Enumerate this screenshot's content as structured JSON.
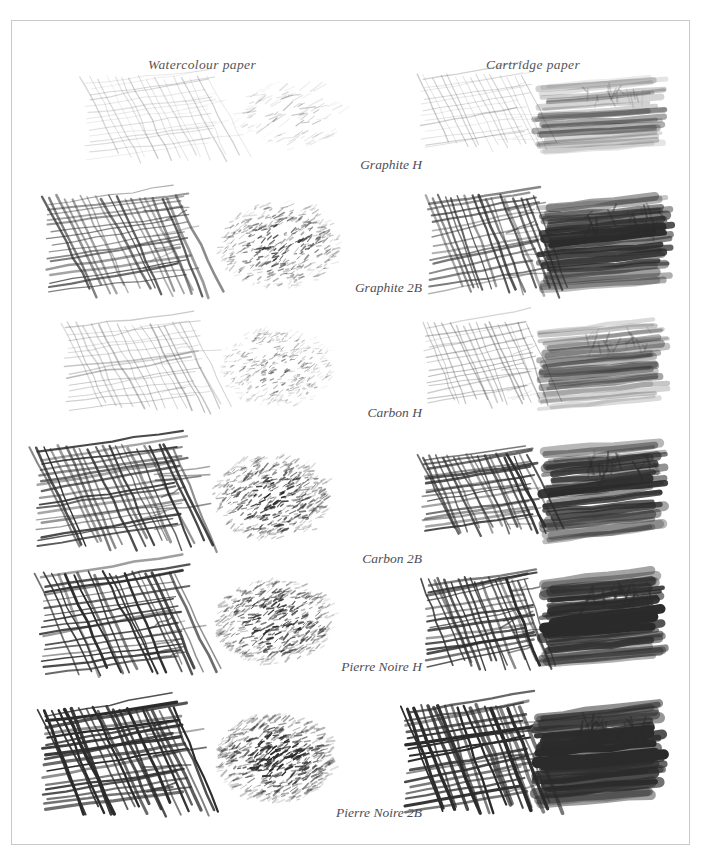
{
  "figure": {
    "background_color": "#ffffff",
    "border_color": "#c9c9c9",
    "ink_color": "#2b2b2b",
    "label_color": "#4e4e55"
  },
  "columns": [
    {
      "id": "watercolour",
      "label": "Watercolour paper"
    },
    {
      "id": "cartridge",
      "label": "Cartridge paper"
    }
  ],
  "rows": [
    {
      "id": "graphite-h",
      "label": "Graphite H",
      "label_top": 136,
      "row_top": 52,
      "samples": [
        {
          "column": "watercolour",
          "style": "hatch",
          "x": 78,
          "y": 8,
          "w": 120,
          "h": 78,
          "tone": 0.17,
          "stroke": 1.0,
          "density": 16,
          "rough": 0.55,
          "seed": 11
        },
        {
          "column": "watercolour",
          "style": "tonal",
          "x": 218,
          "y": 12,
          "w": 110,
          "h": 66,
          "tone": 0.3,
          "stroke": 1.3,
          "density": 120,
          "rough": 0.8,
          "seed": 12
        },
        {
          "column": "cartridge",
          "style": "hatch",
          "x": 413,
          "y": 6,
          "w": 100,
          "h": 70,
          "tone": 0.19,
          "stroke": 1.0,
          "density": 15,
          "rough": 0.3,
          "seed": 13
        },
        {
          "column": "cartridge",
          "style": "smooth",
          "x": 527,
          "y": 10,
          "w": 120,
          "h": 72,
          "tone": 0.33,
          "stroke": 5.0,
          "density": 26,
          "rough": 0.18,
          "seed": 14
        }
      ]
    },
    {
      "id": "graphite-2b",
      "label": "Graphite 2B",
      "label_top": 259,
      "row_top": 174,
      "samples": [
        {
          "column": "watercolour",
          "style": "hatch",
          "x": 40,
          "y": 6,
          "w": 130,
          "h": 92,
          "tone": 0.58,
          "stroke": 1.9,
          "density": 19,
          "rough": 0.45,
          "seed": 21
        },
        {
          "column": "watercolour",
          "style": "grain",
          "x": 205,
          "y": 8,
          "w": 120,
          "h": 86,
          "tone": 0.66,
          "stroke": 1.5,
          "density": 420,
          "rough": 1.0,
          "seed": 22
        },
        {
          "column": "cartridge",
          "style": "hatch",
          "x": 421,
          "y": 6,
          "w": 104,
          "h": 92,
          "tone": 0.6,
          "stroke": 1.9,
          "density": 17,
          "rough": 0.32,
          "seed": 23
        },
        {
          "column": "cartridge",
          "style": "smooth",
          "x": 531,
          "y": 8,
          "w": 122,
          "h": 88,
          "tone": 0.8,
          "stroke": 7.0,
          "density": 30,
          "rough": 0.2,
          "seed": 24
        }
      ]
    },
    {
      "id": "carbon-h",
      "label": "Carbon H",
      "label_top": 384,
      "row_top": 300,
      "samples": [
        {
          "column": "watercolour",
          "style": "hatch",
          "x": 58,
          "y": 6,
          "w": 124,
          "h": 82,
          "tone": 0.26,
          "stroke": 1.2,
          "density": 17,
          "rough": 0.62,
          "seed": 31
        },
        {
          "column": "watercolour",
          "style": "grain",
          "x": 208,
          "y": 8,
          "w": 112,
          "h": 78,
          "tone": 0.46,
          "stroke": 1.2,
          "density": 380,
          "rough": 1.0,
          "seed": 32
        },
        {
          "column": "cartridge",
          "style": "hatch",
          "x": 417,
          "y": 6,
          "w": 100,
          "h": 78,
          "tone": 0.27,
          "stroke": 1.2,
          "density": 16,
          "rough": 0.35,
          "seed": 33
        },
        {
          "column": "cartridge",
          "style": "smooth",
          "x": 531,
          "y": 6,
          "w": 118,
          "h": 84,
          "tone": 0.42,
          "stroke": 6.0,
          "density": 28,
          "rough": 0.2,
          "seed": 34
        }
      ]
    },
    {
      "id": "carbon-2b",
      "label": "Carbon 2B",
      "label_top": 530,
      "row_top": 424,
      "samples": [
        {
          "column": "watercolour",
          "style": "hatch",
          "x": 30,
          "y": 6,
          "w": 136,
          "h": 96,
          "tone": 0.72,
          "stroke": 2.1,
          "density": 21,
          "rough": 0.42,
          "seed": 41
        },
        {
          "column": "watercolour",
          "style": "grain",
          "x": 200,
          "y": 12,
          "w": 118,
          "h": 84,
          "tone": 0.8,
          "stroke": 1.6,
          "density": 470,
          "rough": 1.0,
          "seed": 42
        },
        {
          "column": "cartridge",
          "style": "hatch",
          "x": 415,
          "y": 14,
          "w": 104,
          "h": 72,
          "tone": 0.7,
          "stroke": 2.0,
          "density": 19,
          "rough": 0.3,
          "seed": 43
        },
        {
          "column": "cartridge",
          "style": "smooth",
          "x": 535,
          "y": 4,
          "w": 112,
          "h": 96,
          "tone": 0.78,
          "stroke": 7.5,
          "density": 30,
          "rough": 0.22,
          "seed": 44
        }
      ]
    },
    {
      "id": "pierre-noire-h",
      "label": "Pierre Noire H",
      "label_top": 638,
      "row_top": 552,
      "samples": [
        {
          "column": "watercolour",
          "style": "hatch",
          "x": 34,
          "y": 4,
          "w": 134,
          "h": 96,
          "tone": 0.74,
          "stroke": 2.0,
          "density": 20,
          "rough": 0.46,
          "seed": 51
        },
        {
          "column": "watercolour",
          "style": "grain",
          "x": 202,
          "y": 8,
          "w": 118,
          "h": 84,
          "tone": 0.84,
          "stroke": 1.6,
          "density": 500,
          "rough": 1.0,
          "seed": 52
        },
        {
          "column": "cartridge",
          "style": "hatch",
          "x": 417,
          "y": 10,
          "w": 100,
          "h": 84,
          "tone": 0.76,
          "stroke": 2.1,
          "density": 18,
          "rough": 0.34,
          "seed": 53
        },
        {
          "column": "cartridge",
          "style": "smooth",
          "x": 533,
          "y": 8,
          "w": 114,
          "h": 88,
          "tone": 0.9,
          "stroke": 8.0,
          "density": 32,
          "rough": 0.22,
          "seed": 54
        }
      ]
    },
    {
      "id": "pierre-noire-2b",
      "label": "Pierre Noire 2B",
      "label_top": 784,
      "row_top": 686,
      "samples": [
        {
          "column": "watercolour",
          "style": "hatch",
          "x": 36,
          "y": 6,
          "w": 132,
          "h": 98,
          "tone": 0.86,
          "stroke": 2.4,
          "density": 21,
          "rough": 0.44,
          "seed": 61
        },
        {
          "column": "watercolour",
          "style": "grain",
          "x": 204,
          "y": 8,
          "w": 116,
          "h": 88,
          "tone": 0.9,
          "stroke": 1.8,
          "density": 540,
          "rough": 1.0,
          "seed": 62
        },
        {
          "column": "cartridge",
          "style": "hatch",
          "x": 398,
          "y": 4,
          "w": 116,
          "h": 100,
          "tone": 0.9,
          "stroke": 2.6,
          "density": 20,
          "rough": 0.36,
          "seed": 63
        },
        {
          "column": "cartridge",
          "style": "smooth",
          "x": 527,
          "y": 6,
          "w": 118,
          "h": 96,
          "tone": 0.97,
          "stroke": 9.0,
          "density": 34,
          "rough": 0.24,
          "seed": 64
        }
      ]
    }
  ]
}
